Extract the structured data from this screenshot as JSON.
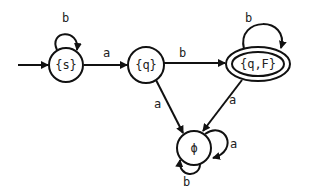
{
  "diagram": {
    "type": "finite-state-automaton",
    "start_state": "{s}",
    "states": [
      {
        "id": "s",
        "label": "{s}",
        "accepting": false
      },
      {
        "id": "q",
        "label": "{q}",
        "accepting": false
      },
      {
        "id": "qF",
        "label": "{q,F}",
        "accepting": true
      },
      {
        "id": "phi",
        "label": "ϕ",
        "accepting": false
      }
    ],
    "transitions": [
      {
        "from": "{s}",
        "to": "{s}",
        "label": "b"
      },
      {
        "from": "{s}",
        "to": "{q}",
        "label": "a"
      },
      {
        "from": "{q}",
        "to": "{q,F}",
        "label": "b"
      },
      {
        "from": "{q}",
        "to": "ϕ",
        "label": "a"
      },
      {
        "from": "{q,F}",
        "to": "{q,F}",
        "label": "b"
      },
      {
        "from": "{q,F}",
        "to": "ϕ",
        "label": "a"
      },
      {
        "from": "ϕ",
        "to": "ϕ",
        "label": "a"
      },
      {
        "from": "ϕ",
        "to": "ϕ",
        "label": "b"
      }
    ]
  }
}
